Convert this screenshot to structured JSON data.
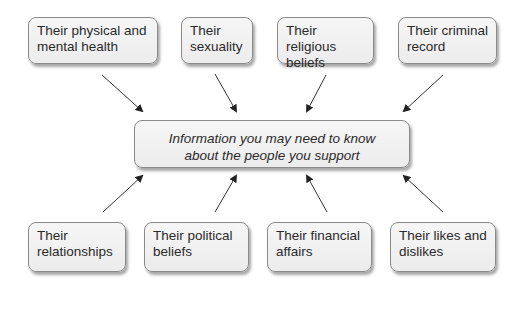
{
  "diagram": {
    "center": {
      "line1": "Information you may need to know",
      "line2": "about the people you support"
    },
    "top": [
      {
        "line1": "Their physical and",
        "line2": "mental health"
      },
      {
        "line1": "Their",
        "line2": "sexuality"
      },
      {
        "line1": "Their religious",
        "line2": "beliefs"
      },
      {
        "line1": "Their criminal",
        "line2": "record"
      }
    ],
    "bottom": [
      {
        "line1": "Their",
        "line2": "relationships"
      },
      {
        "line1": "Their political",
        "line2": "beliefs"
      },
      {
        "line1": "Their financial",
        "line2": "affairs"
      },
      {
        "line1": "Their likes and",
        "line2": "dislikes"
      }
    ],
    "colors": {
      "box_fill": "#efefef",
      "box_border": "#8a8a8a",
      "arrow": "#222222",
      "text": "#2a2a2a"
    }
  }
}
